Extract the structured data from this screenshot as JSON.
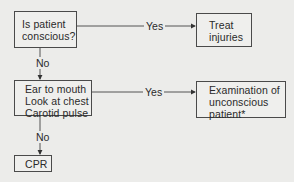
{
  "diagram": {
    "type": "flowchart",
    "nodes": [
      {
        "id": "q_conscious",
        "lines": [
          "Is patient",
          "conscious?"
        ]
      },
      {
        "id": "treat",
        "lines": [
          "Treat",
          "injuries"
        ]
      },
      {
        "id": "check",
        "lines": [
          "Ear to mouth",
          "Look at chest",
          "Carotid pulse"
        ]
      },
      {
        "id": "exam",
        "lines": [
          "Examination of",
          "unconscious",
          "patient*"
        ]
      },
      {
        "id": "cpr",
        "lines": [
          "CPR"
        ]
      }
    ],
    "edges": [
      {
        "from": "q_conscious",
        "to": "treat",
        "label": "Yes"
      },
      {
        "from": "q_conscious",
        "to": "check",
        "label": "No"
      },
      {
        "from": "check",
        "to": "exam",
        "label": "Yes"
      },
      {
        "from": "check",
        "to": "cpr",
        "label": "No"
      }
    ]
  }
}
